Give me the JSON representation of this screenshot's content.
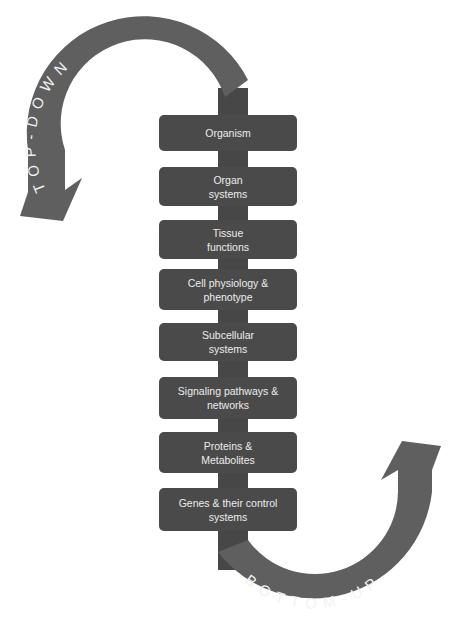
{
  "diagram": {
    "arrows": {
      "top": {
        "label": "TOP-DOWN",
        "direction": "down",
        "color": "#5f5f5f"
      },
      "bottom": {
        "label": "BOTTOM-UP",
        "direction": "up",
        "color": "#5f5f5f"
      }
    },
    "spine_color": "#474747",
    "box_color": "#4a4a4a",
    "text_color": "#ececec",
    "levels": [
      {
        "line1": "Organism",
        "line2": ""
      },
      {
        "line1": "Organ",
        "line2": "systems"
      },
      {
        "line1": "Tissue",
        "line2": "functions"
      },
      {
        "line1": "Cell physiology &",
        "line2": "phenotype"
      },
      {
        "line1": "Subcellular",
        "line2": "systems"
      },
      {
        "line1": "Signaling pathways &",
        "line2": "networks"
      },
      {
        "line1": "Proteins &",
        "line2": "Metabolites"
      },
      {
        "line1": "Genes & their control",
        "line2": "systems"
      }
    ]
  }
}
